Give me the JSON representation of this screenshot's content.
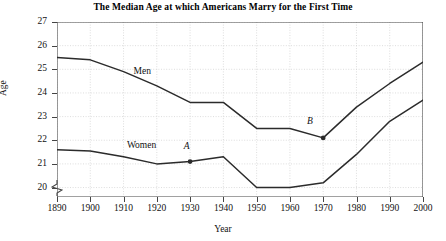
{
  "chart_data": {
    "type": "line",
    "title": "The Median Age at which Americans Marry for the First Time",
    "xlabel": "Year",
    "ylabel": "Age",
    "x": [
      1890,
      1900,
      1910,
      1920,
      1930,
      1940,
      1950,
      1960,
      1970,
      1980,
      1990,
      2000
    ],
    "xlim": [
      1890,
      2000
    ],
    "ylim": [
      19.6,
      27
    ],
    "y_ticks": [
      20,
      21,
      22,
      23,
      24,
      25,
      26,
      27
    ],
    "x_ticks": [
      1890,
      1900,
      1910,
      1920,
      1930,
      1940,
      1950,
      1960,
      1970,
      1980,
      1990,
      2000
    ],
    "grid": true,
    "axis_break_y": true,
    "legend": "inline-labels",
    "series": [
      {
        "name": "Men",
        "label_position": {
          "x": 1913,
          "y": 24.9
        },
        "values": [
          25.5,
          25.4,
          24.9,
          24.3,
          23.6,
          23.6,
          22.5,
          22.5,
          22.1,
          23.4,
          24.4,
          25.3
        ]
      },
      {
        "name": "Women",
        "label_position": {
          "x": 1911,
          "y": 21.75
        },
        "values": [
          21.6,
          21.55,
          21.3,
          21.0,
          21.1,
          21.3,
          20.0,
          20.0,
          20.2,
          21.4,
          22.8,
          23.7
        ]
      }
    ],
    "annotated_points": [
      {
        "label": "A",
        "series": "Women",
        "x": 1930,
        "y": 21.1,
        "label_offset": {
          "dx": -1,
          "dy": 0.45
        }
      },
      {
        "label": "B",
        "series": "Men",
        "x": 1970,
        "y": 22.1,
        "label_offset": {
          "dx": -4,
          "dy": 0.5
        }
      }
    ],
    "line_color": "#2b2b2b",
    "grid_color": "#cfcfcf",
    "axis_color": "#444444",
    "background": "#ffffff"
  }
}
